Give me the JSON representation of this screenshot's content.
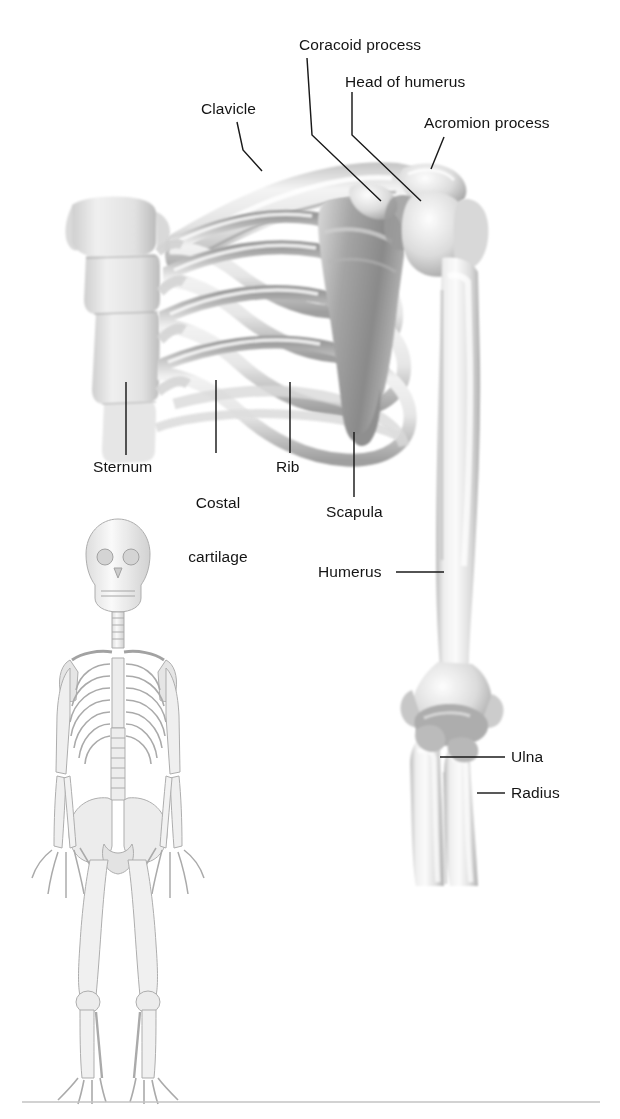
{
  "figure": {
    "background_color": "#ffffff",
    "ink_color": "#1a1a1a",
    "bone_light": "#eeeeee",
    "bone_mid": "#c9c9c9",
    "bone_shade": "#9b9b9b",
    "bone_dark": "#7d7d7d",
    "rule_color": "#c3c3c3"
  },
  "labels": {
    "coracoid_process": "Coracoid process",
    "head_of_humerus": "Head of humerus",
    "acromion_process": "Acromion process",
    "clavicle": "Clavicle",
    "sternum": "Sternum",
    "costal_cartilage_line1": "Costal",
    "costal_cartilage_line2": "cartilage",
    "rib": "Rib",
    "scapula": "Scapula",
    "humerus": "Humerus",
    "ulna": "Ulna",
    "radius": "Radius"
  },
  "insets": {
    "whole_skeleton_caption": ""
  },
  "structures": [
    {
      "name": "clavicle",
      "label": "Clavicle"
    },
    {
      "name": "coracoid-process",
      "label": "Coracoid process"
    },
    {
      "name": "head-of-humerus",
      "label": "Head of humerus"
    },
    {
      "name": "acromion-process",
      "label": "Acromion process"
    },
    {
      "name": "sternum",
      "label": "Sternum"
    },
    {
      "name": "costal-cartilage",
      "label": "Costal cartilage"
    },
    {
      "name": "rib",
      "label": "Rib"
    },
    {
      "name": "scapula",
      "label": "Scapula"
    },
    {
      "name": "humerus",
      "label": "Humerus"
    },
    {
      "name": "ulna",
      "label": "Ulna"
    },
    {
      "name": "radius",
      "label": "Radius"
    }
  ]
}
